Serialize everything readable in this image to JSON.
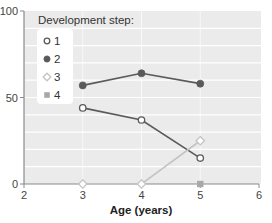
{
  "chart_data": {
    "type": "line",
    "title": "",
    "xlabel": "Age (years)",
    "ylabel": "",
    "x_ticks": [
      2,
      3,
      4,
      5,
      6
    ],
    "y_ticks": [
      0,
      50,
      100
    ],
    "xlim": [
      2,
      6
    ],
    "ylim": [
      0,
      100
    ],
    "grid": "horizontal every 10",
    "legend": {
      "title": "Development step:",
      "position": "upper-left",
      "entries": [
        "1",
        "2",
        "3",
        "4"
      ]
    },
    "series": [
      {
        "name": "1",
        "marker": "open-circle",
        "color": "#5a5a5a",
        "x": [
          3,
          4,
          5
        ],
        "values": [
          44,
          37,
          15
        ]
      },
      {
        "name": "2",
        "marker": "filled-circle",
        "color": "#5a5a5a",
        "x": [
          3,
          4,
          5
        ],
        "values": [
          57,
          64,
          58
        ]
      },
      {
        "name": "3",
        "marker": "open-diamond",
        "color": "#c4c4c4",
        "x": [
          3,
          4,
          5
        ],
        "values": [
          0,
          0,
          25
        ]
      },
      {
        "name": "4",
        "marker": "filled-square",
        "color": "#a8a8a8",
        "x": [
          5
        ],
        "values": [
          0
        ]
      }
    ]
  },
  "colors": {
    "plot_background": "#ebebeb",
    "gridline": "#ffffff",
    "axis": "#8a8a8a"
  }
}
